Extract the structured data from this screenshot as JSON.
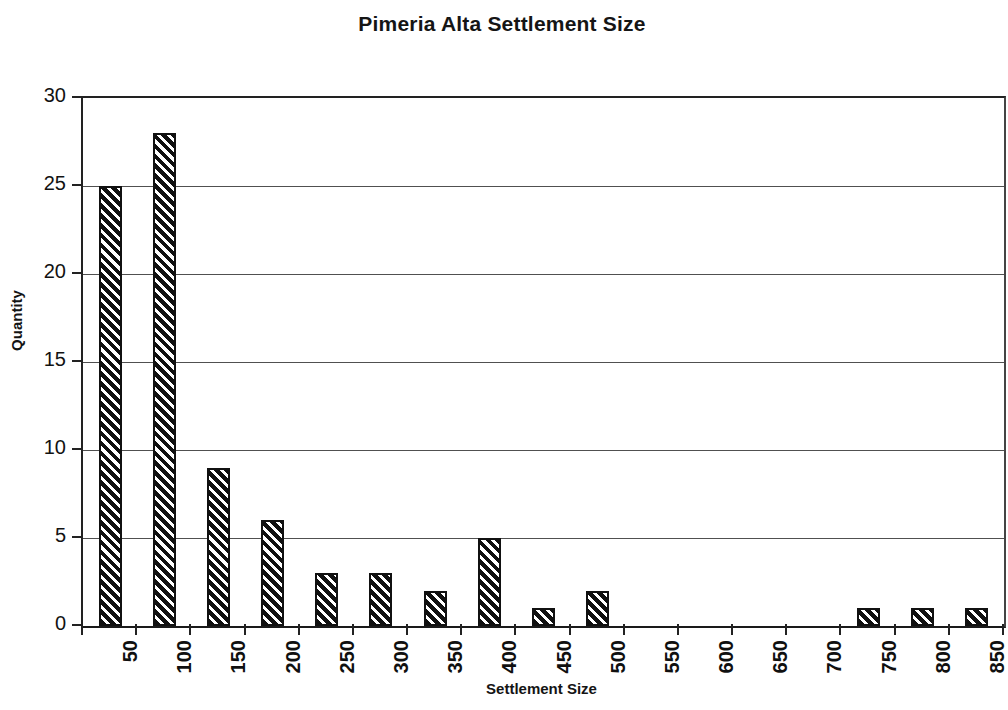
{
  "chart_data": {
    "type": "bar",
    "title": "Pimeria Alta Settlement Size",
    "xlabel": "Settlement Size",
    "ylabel": "Quantity",
    "categories": [
      "50",
      "100",
      "150",
      "200",
      "250",
      "300",
      "350",
      "400",
      "450",
      "500",
      "550",
      "600",
      "650",
      "700",
      "750",
      "800",
      "850"
    ],
    "values": [
      25,
      28,
      9,
      6,
      3,
      3,
      2,
      5,
      1,
      2,
      0,
      0,
      0,
      0,
      1,
      1,
      1
    ],
    "ylim": [
      0,
      30
    ],
    "y_ticks": [
      0,
      5,
      10,
      15,
      20,
      25,
      30
    ],
    "y_tick_labels": [
      "0",
      "5",
      "10",
      "15",
      "20",
      "25",
      "30"
    ],
    "grid": "horizontal",
    "legend": "none",
    "bar_fill": "diagonal-hatch",
    "bar_fill_color": "#101010",
    "bar_edge_color": "#111111",
    "background_color": "#ffffff",
    "axis_color": "#222222",
    "gridline_color": "#505050"
  }
}
